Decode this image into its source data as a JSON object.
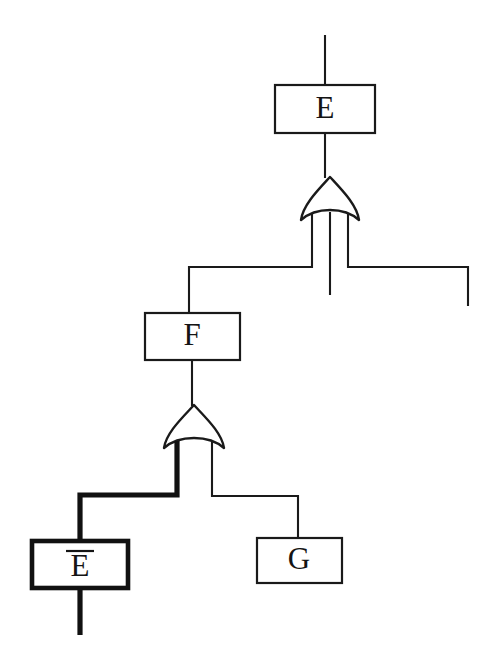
{
  "diagram": {
    "type": "fault-tree",
    "title": "",
    "background_color": "#ffffff",
    "line_color": "#1a1a1a",
    "highlight_color": "#111111",
    "nodes": [
      {
        "id": "top-event",
        "label": "E",
        "shape": "rectangle",
        "emphasis": "normal",
        "x": 275,
        "y": 85,
        "w": 100,
        "h": 48
      },
      {
        "id": "intermediate-event",
        "label": "F",
        "shape": "rectangle",
        "emphasis": "normal",
        "x": 145,
        "y": 313,
        "w": 95,
        "h": 47
      },
      {
        "id": "basic-event-e-not",
        "label": "E",
        "label_overbar": true,
        "shape": "rectangle",
        "emphasis": "bold",
        "x": 32,
        "y": 541,
        "w": 96,
        "h": 47
      },
      {
        "id": "basic-event-g",
        "label": "G",
        "shape": "rectangle",
        "emphasis": "normal",
        "x": 257,
        "y": 538,
        "w": 85,
        "h": 45
      }
    ],
    "gates": [
      {
        "id": "top-or-gate",
        "kind": "or",
        "output_node": "top-event",
        "inputs": [
          "intermediate-event",
          "dangling-right-stub"
        ],
        "cx": 330,
        "top_y": 178,
        "bottom_y": 220,
        "half_w": 31
      },
      {
        "id": "lower-or-gate",
        "kind": "or",
        "output_node": "intermediate-event",
        "inputs": [
          "basic-event-e-not",
          "basic-event-g"
        ],
        "cx": 194,
        "top_y": 405,
        "bottom_y": 448,
        "half_w": 31
      }
    ],
    "highlighted_path": {
      "description": "bold cut-set path",
      "from_gate": "lower-or-gate",
      "to_node": "basic-event-e-not"
    },
    "open_stubs": [
      {
        "id": "top-input-stub",
        "x": 325,
        "y1": 35,
        "y2": 85
      },
      {
        "id": "top-gate-center-stub",
        "x": 330,
        "y1": 220,
        "y2": 295
      },
      {
        "id": "dangling-right-stub",
        "x": 468,
        "y1": 266,
        "y2": 306
      },
      {
        "id": "bottom-output-stub",
        "x": 80,
        "y1": 588,
        "y2": 635
      }
    ]
  },
  "labels": {
    "top_event": "E",
    "intermediate_event": "F",
    "basic_event_negated": "E",
    "basic_event_g": "G"
  }
}
